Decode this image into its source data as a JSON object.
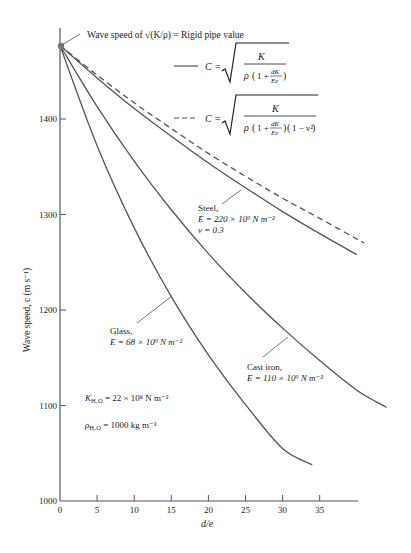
{
  "chart_data": {
    "type": "line",
    "title": "",
    "xlabel": "d/e",
    "ylabel": "Wave speed, c (m s⁻¹)",
    "xlim": [
      0,
      45
    ],
    "ylim": [
      1000,
      1480
    ],
    "xticks": [
      0,
      5,
      10,
      15,
      20,
      25,
      30,
      35
    ],
    "xtick_labels": [
      "0",
      "5",
      "10",
      "15",
      "20",
      "25",
      "30",
      "35"
    ],
    "yticks": [
      1000,
      1100,
      1200,
      1300,
      1400
    ],
    "ytick_labels": [
      "1000",
      "1100",
      "1200",
      "1300",
      "1400"
    ],
    "grid": false,
    "rigid_point": {
      "x": 0,
      "y": 1477,
      "label": "Wave speed of √(K/ρ) = Rigid pipe value"
    },
    "legend": [
      {
        "style": "solid",
        "label": "C = √( K / (ρ(1 + dK/Ee)) )"
      },
      {
        "style": "dashed",
        "label": "C = √( K / (ρ(1 + dK/Ee)(1 − ν²)) )"
      }
    ],
    "series": [
      {
        "name": "Steel (solid)",
        "style": "solid",
        "x": [
          0,
          5,
          10,
          15,
          20,
          25,
          30,
          35,
          40
        ],
        "values": [
          1477,
          1443,
          1411,
          1382,
          1354,
          1328,
          1303,
          1280,
          1258
        ]
      },
      {
        "name": "Steel, ν = 0.3 (dashed)",
        "style": "dashed",
        "x": [
          0,
          5,
          10,
          15,
          20,
          25,
          30,
          35,
          41
        ],
        "values": [
          1477,
          1446,
          1417,
          1390,
          1364,
          1340,
          1317,
          1296,
          1270
        ]
      },
      {
        "name": "Cast iron",
        "style": "solid",
        "x": [
          0,
          5,
          10,
          15,
          20,
          25,
          30,
          35,
          40,
          44
        ],
        "values": [
          1477,
          1413,
          1356,
          1305,
          1259,
          1218,
          1181,
          1147,
          1116,
          1098
        ]
      },
      {
        "name": "Glass",
        "style": "solid",
        "x": [
          0,
          5,
          10,
          15,
          20,
          25,
          30,
          34
        ],
        "values": [
          1477,
          1372,
          1286,
          1214,
          1153,
          1101,
          1055,
          1038
        ]
      }
    ],
    "annotations": [
      {
        "text": [
          "Steel,",
          "E = 220 × 10⁹ N m⁻²",
          "ν = 0.3"
        ]
      },
      {
        "text": [
          "Cast iron,",
          "E = 110 × 10⁹ N m⁻²"
        ]
      },
      {
        "text": [
          "Glass,",
          "E = 68 × 10⁹ N m⁻²"
        ]
      },
      {
        "text": [
          "K_H₂O = 22 × 10⁸ N m⁻²"
        ]
      },
      {
        "text": [
          "ρ_H₂O = 1000 kg m⁻³"
        ]
      }
    ]
  },
  "labels": {
    "rigid": "Wave speed of √(K/ρ) = Rigid pipe value",
    "ylabel": "Wave speed, c (m s⁻¹)",
    "xlabel": "d/e",
    "steel1": "Steel,",
    "steel2": "E = 220 × 10⁹ N m⁻²",
    "steel3": "ν = 0.3",
    "cast1": "Cast iron,",
    "cast2": "E = 110 × 10⁹ N m⁻²",
    "glass1": "Glass,",
    "glass2": "E = 68 × 10⁹ N m⁻²",
    "kwater": "K",
    "kwater_sub": "H₂O",
    "kwater_val": " = 22 × 10⁸ N m⁻²",
    "rho": "ρ",
    "rho_sub": "H₂O",
    "rho_val": " = 1000 kg m⁻³",
    "c_eq": "C =",
    "K": "K",
    "rho_sym": "ρ",
    "one_plus": "1 +",
    "dK": "dK",
    "Ee": "Ee",
    "one_minus_nu": "1 − ν²"
  },
  "colors": {
    "curve": "#555555",
    "axis": "#555555",
    "point": "#777777"
  }
}
